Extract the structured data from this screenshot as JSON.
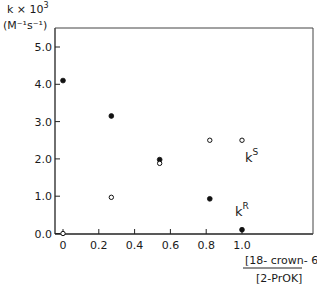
{
  "chart_data": {
    "type": "scatter",
    "title": "",
    "ylabel": "k × 10³ (M⁻¹ s⁻¹)",
    "ylabel_line1": "k × 10",
    "ylabel_exp": "3",
    "ylabel_line2": "(M⁻¹s⁻¹)",
    "xlabel": "[18-crown-6] / [2-PrOK]",
    "xlabel_numerator": "[18- crown- 6]",
    "xlabel_denominator": "[2-PrOK]",
    "xlim": [
      0,
      1.25
    ],
    "ylim": [
      0,
      5.5
    ],
    "x_ticks": [
      0,
      0.2,
      0.4,
      0.6,
      0.8,
      1.0
    ],
    "x_tick_labels": [
      "0",
      "0.2",
      "0.4",
      "0.6",
      "0.8",
      "1.0"
    ],
    "y_ticks": [
      0,
      1,
      2,
      3,
      4,
      5
    ],
    "y_tick_labels": [
      "0.0",
      "1.0",
      "2.0",
      "3.0",
      "4.0",
      "5.0"
    ],
    "grid": false,
    "legend": "inline labels",
    "series": [
      {
        "name": "kR",
        "label": "k",
        "label_sup": "R",
        "marker": "filled-circle",
        "x": [
          0,
          0.27,
          0.54,
          0.82,
          1.0
        ],
        "y": [
          4.1,
          3.15,
          1.98,
          0.93,
          0.1
        ]
      },
      {
        "name": "kS",
        "label": "k",
        "label_sup": "S",
        "marker": "open-circle",
        "x": [
          0,
          0.27,
          0.54,
          0.82,
          1.0
        ],
        "y": [
          0.0,
          0.97,
          1.88,
          2.5,
          2.5
        ]
      }
    ]
  }
}
